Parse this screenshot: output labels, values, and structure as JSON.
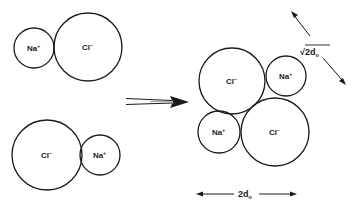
{
  "diagram": {
    "colors": {
      "stroke": "#1a1a1a",
      "background": "#ffffff"
    },
    "left_pairs": [
      {
        "name": "top-pair",
        "ions": [
          {
            "symbol": "Na",
            "charge": "+",
            "cx": 34,
            "cy": 48,
            "r": 20
          },
          {
            "symbol": "Cl",
            "charge": "−",
            "cx": 88,
            "cy": 47,
            "r": 34
          }
        ]
      },
      {
        "name": "bottom-pair",
        "ions": [
          {
            "symbol": "Cl",
            "charge": "−",
            "cx": 47,
            "cy": 155,
            "r": 35
          },
          {
            "symbol": "Na",
            "charge": "+",
            "cx": 100,
            "cy": 155,
            "r": 20
          }
        ]
      }
    ],
    "reaction_arrow": {
      "from_x": 126,
      "to_x": 189,
      "y": 102
    },
    "cluster": {
      "ions": [
        {
          "name": "cluster-cl-top-left",
          "symbol": "Cl",
          "charge": "−",
          "cx": 232,
          "cy": 81,
          "r": 33
        },
        {
          "name": "cluster-na-top-right",
          "symbol": "Na",
          "charge": "+",
          "cx": 286,
          "cy": 76,
          "r": 20
        },
        {
          "name": "cluster-na-bottom-left",
          "symbol": "Na",
          "charge": "+",
          "cx": 219,
          "cy": 132,
          "r": 21
        },
        {
          "name": "cluster-cl-bottom-right",
          "symbol": "Cl",
          "charge": "−",
          "cx": 275,
          "cy": 132,
          "r": 34
        }
      ]
    },
    "dimensions": {
      "diagonal": {
        "radical": "√",
        "value": "2d",
        "subscript": "o",
        "label": "√2d₀"
      },
      "horizontal": {
        "value": "2d",
        "subscript": "o",
        "label": "2d₀"
      }
    }
  }
}
